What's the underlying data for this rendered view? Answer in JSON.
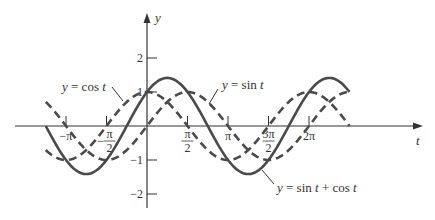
{
  "chart_data": {
    "type": "line",
    "title": "",
    "xlabel": "t",
    "ylabel": "y",
    "x_range_radians": [
      -3.927,
      7.854
    ],
    "y_range": [
      -2.2,
      3.2
    ],
    "grid": false,
    "x_ticks": [
      {
        "value": -3.14159,
        "label": "−π"
      },
      {
        "value": -1.5708,
        "label_num": "π",
        "label_den": "2",
        "sign": "−"
      },
      {
        "value": 1.5708,
        "label_num": "π",
        "label_den": "2",
        "sign": ""
      },
      {
        "value": 3.14159,
        "label": "π"
      },
      {
        "value": 4.71239,
        "label_num": "3π",
        "label_den": "2",
        "sign": ""
      },
      {
        "value": 6.28319,
        "label": "2π"
      }
    ],
    "y_ticks": [
      {
        "value": 2,
        "label": "2"
      },
      {
        "value": 1,
        "label": "1"
      },
      {
        "value": -1,
        "label": "−1"
      },
      {
        "value": -2,
        "label": "−2"
      }
    ],
    "series": [
      {
        "name": "y = sin t",
        "function": "sin",
        "style": "dashed",
        "t_start": -3.927,
        "t_end": 7.854
      },
      {
        "name": "y = cos t",
        "function": "cos",
        "style": "dashed",
        "t_start": -3.927,
        "t_end": 7.854
      },
      {
        "name": "y = sin t + cos t",
        "function": "sin+cos",
        "style": "solid",
        "t_start": -3.927,
        "t_end": 7.854
      }
    ],
    "annotations": [
      {
        "text_prefix": "y",
        "text_mid": " = cos ",
        "text_suffix": "t",
        "series": "cos"
      },
      {
        "text_prefix": "y",
        "text_mid": " = sin ",
        "text_suffix": "t",
        "series": "sin"
      },
      {
        "text_prefix": "y",
        "text_mid": " = sin ",
        "text_t1": "t",
        "text_mid2": " + cos ",
        "text_suffix": "t",
        "series": "sin+cos"
      }
    ]
  },
  "colors": {
    "axis": "#333333",
    "curve": "#4a4a4a"
  }
}
